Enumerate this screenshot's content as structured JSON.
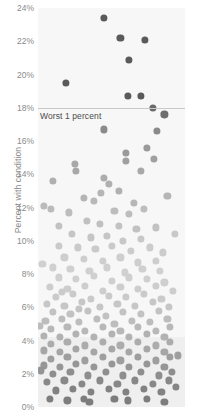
{
  "chart_data": {
    "type": "scatter",
    "title": "",
    "subtitle": "",
    "xlabel": "",
    "ylabel": "Percent with condition",
    "ylim": [
      0,
      24
    ],
    "xlim": [
      0,
      100
    ],
    "grid": false,
    "legend": null,
    "y_ticks": [
      "0%",
      "2%",
      "4%",
      "6%",
      "8%",
      "10%",
      "12%",
      "14%",
      "16%",
      "18%",
      "20%",
      "22%",
      "24%"
    ],
    "y_tick_values": [
      0,
      2,
      4,
      6,
      8,
      10,
      12,
      14,
      16,
      18,
      20,
      22,
      24
    ],
    "x_ticks": [],
    "annotations": [
      {
        "name": "worst-1-percent",
        "text": "Worst 1 percent",
        "y_value": 18,
        "line": true
      }
    ],
    "shaded_bands": [
      {
        "name": "low-band",
        "y_from": 0,
        "y_to": 4.2,
        "color": "#efefef"
      }
    ],
    "panel_background": "#f7f7f7",
    "dot_colors": {
      "very_high": "#5a5a5a",
      "high": "#9a9a9a",
      "mid": "#bdbdbd",
      "low_mid": "#cfcfcf",
      "light": "#dedede",
      "dense_dark": "#8e8e8e",
      "bottom": "#7d7d7d"
    },
    "points": [
      {
        "x": 45,
        "y": 23.4,
        "r": 3.6,
        "c": "#5a5a5a"
      },
      {
        "x": 56,
        "y": 22.2,
        "r": 3.6,
        "c": "#5a5a5a"
      },
      {
        "x": 73,
        "y": 22.1,
        "r": 3.6,
        "c": "#5a5a5a"
      },
      {
        "x": 62,
        "y": 20.9,
        "r": 3.6,
        "c": "#5a5a5a"
      },
      {
        "x": 19,
        "y": 19.5,
        "r": 3.6,
        "c": "#5a5a5a"
      },
      {
        "x": 61,
        "y": 18.7,
        "r": 3.6,
        "c": "#5a5a5a"
      },
      {
        "x": 70,
        "y": 18.7,
        "r": 3.6,
        "c": "#5a5a5a"
      },
      {
        "x": 78,
        "y": 18.0,
        "r": 3.6,
        "c": "#6a6a6a"
      },
      {
        "x": 86,
        "y": 17.6,
        "r": 3.6,
        "c": "#6e6e6e"
      },
      {
        "x": 45,
        "y": 16.7,
        "r": 3.6,
        "c": "#8a8a8a"
      },
      {
        "x": 81,
        "y": 16.6,
        "r": 3.6,
        "c": "#8a8a8a"
      },
      {
        "x": 74,
        "y": 15.6,
        "r": 3.6,
        "c": "#9a9a9a"
      },
      {
        "x": 60,
        "y": 15.3,
        "r": 3.6,
        "c": "#9a9a9a"
      },
      {
        "x": 60,
        "y": 14.8,
        "r": 3.6,
        "c": "#a0a0a0"
      },
      {
        "x": 79,
        "y": 14.9,
        "r": 3.6,
        "c": "#a0a0a0"
      },
      {
        "x": 25,
        "y": 14.6,
        "r": 3.6,
        "c": "#a8a8a8"
      },
      {
        "x": 26,
        "y": 14.2,
        "r": 3.6,
        "c": "#a8a8a8"
      },
      {
        "x": 70,
        "y": 14.2,
        "r": 3.6,
        "c": "#a8a8a8"
      },
      {
        "x": 45,
        "y": 13.8,
        "r": 3.6,
        "c": "#adadad"
      },
      {
        "x": 10,
        "y": 13.6,
        "r": 3.6,
        "c": "#b0b0b0"
      },
      {
        "x": 48,
        "y": 13.4,
        "r": 3.6,
        "c": "#b0b0b0"
      },
      {
        "x": 43,
        "y": 12.9,
        "r": 3.6,
        "c": "#b5b5b5"
      },
      {
        "x": 31,
        "y": 12.6,
        "r": 3.6,
        "c": "#b5b5b5"
      },
      {
        "x": 38,
        "y": 12.4,
        "r": 3.6,
        "c": "#b8b8b8"
      },
      {
        "x": 4,
        "y": 12.1,
        "r": 3.6,
        "c": "#bbbbbb"
      },
      {
        "x": 9,
        "y": 11.9,
        "r": 3.6,
        "c": "#bbbbbb"
      },
      {
        "x": 21,
        "y": 11.7,
        "r": 3.6,
        "c": "#bdbdbd"
      },
      {
        "x": 52,
        "y": 11.8,
        "r": 3.6,
        "c": "#bdbdbd"
      },
      {
        "x": 62,
        "y": 11.6,
        "r": 3.6,
        "c": "#bdbdbd"
      },
      {
        "x": 72,
        "y": 11.9,
        "r": 3.6,
        "c": "#bdbdbd"
      },
      {
        "x": 33,
        "y": 11.2,
        "r": 3.6,
        "c": "#c0c0c0"
      },
      {
        "x": 42,
        "y": 11.0,
        "r": 3.6,
        "c": "#c0c0c0"
      },
      {
        "x": 55,
        "y": 10.9,
        "r": 3.6,
        "c": "#c2c2c2"
      },
      {
        "x": 67,
        "y": 10.7,
        "r": 3.6,
        "c": "#c2c2c2"
      },
      {
        "x": 80,
        "y": 10.8,
        "r": 3.6,
        "c": "#c2c2c2"
      },
      {
        "x": 23,
        "y": 10.4,
        "r": 3.6,
        "c": "#c5c5c5"
      },
      {
        "x": 36,
        "y": 10.2,
        "r": 3.6,
        "c": "#c5c5c5"
      },
      {
        "x": 47,
        "y": 10.3,
        "r": 3.6,
        "c": "#c5c5c5"
      },
      {
        "x": 58,
        "y": 10.0,
        "r": 3.6,
        "c": "#c8c8c8"
      },
      {
        "x": 70,
        "y": 10.1,
        "r": 3.6,
        "c": "#c8c8c8"
      },
      {
        "x": 14,
        "y": 9.7,
        "r": 3.6,
        "c": "#cacaca"
      },
      {
        "x": 27,
        "y": 9.6,
        "r": 3.6,
        "c": "#cacaca"
      },
      {
        "x": 39,
        "y": 9.5,
        "r": 3.6,
        "c": "#cacaca"
      },
      {
        "x": 50,
        "y": 9.7,
        "r": 3.6,
        "c": "#cacaca"
      },
      {
        "x": 63,
        "y": 9.4,
        "r": 3.6,
        "c": "#cccccc"
      },
      {
        "x": 76,
        "y": 9.6,
        "r": 3.6,
        "c": "#cccccc"
      },
      {
        "x": 85,
        "y": 9.3,
        "r": 3.6,
        "c": "#cccccc"
      },
      {
        "x": 18,
        "y": 9.0,
        "r": 3.6,
        "c": "#cecece"
      },
      {
        "x": 31,
        "y": 8.9,
        "r": 3.6,
        "c": "#cecece"
      },
      {
        "x": 44,
        "y": 8.8,
        "r": 3.6,
        "c": "#cecece"
      },
      {
        "x": 56,
        "y": 9.0,
        "r": 3.6,
        "c": "#cecece"
      },
      {
        "x": 68,
        "y": 8.7,
        "r": 3.6,
        "c": "#cecece"
      },
      {
        "x": 80,
        "y": 8.8,
        "r": 3.6,
        "c": "#cecece"
      },
      {
        "x": 10,
        "y": 8.4,
        "r": 3.6,
        "c": "#d0d0d0"
      },
      {
        "x": 22,
        "y": 8.3,
        "r": 3.6,
        "c": "#d0d0d0"
      },
      {
        "x": 35,
        "y": 8.2,
        "r": 3.6,
        "c": "#d0d0d0"
      },
      {
        "x": 47,
        "y": 8.4,
        "r": 3.6,
        "c": "#d0d0d0"
      },
      {
        "x": 59,
        "y": 8.1,
        "r": 3.6,
        "c": "#d0d0d0"
      },
      {
        "x": 71,
        "y": 8.3,
        "r": 3.6,
        "c": "#d0d0d0"
      },
      {
        "x": 83,
        "y": 8.2,
        "r": 3.6,
        "c": "#d0d0d0"
      },
      {
        "x": 14,
        "y": 7.8,
        "r": 3.6,
        "c": "#d0d0d0"
      },
      {
        "x": 26,
        "y": 7.7,
        "r": 3.6,
        "c": "#d0d0d0"
      },
      {
        "x": 38,
        "y": 7.9,
        "r": 3.6,
        "c": "#d0d0d0"
      },
      {
        "x": 50,
        "y": 7.6,
        "r": 3.6,
        "c": "#cfcfcf"
      },
      {
        "x": 62,
        "y": 7.8,
        "r": 3.6,
        "c": "#cfcfcf"
      },
      {
        "x": 74,
        "y": 7.7,
        "r": 3.6,
        "c": "#cfcfcf"
      },
      {
        "x": 86,
        "y": 7.5,
        "r": 3.6,
        "c": "#cfcfcf"
      },
      {
        "x": 8,
        "y": 7.2,
        "r": 3.6,
        "c": "#cdcdcd"
      },
      {
        "x": 20,
        "y": 7.1,
        "r": 3.6,
        "c": "#cdcdcd"
      },
      {
        "x": 32,
        "y": 7.3,
        "r": 3.6,
        "c": "#cdcdcd"
      },
      {
        "x": 44,
        "y": 7.0,
        "r": 3.6,
        "c": "#cdcdcd"
      },
      {
        "x": 56,
        "y": 7.2,
        "r": 3.6,
        "c": "#cdcdcd"
      },
      {
        "x": 68,
        "y": 7.1,
        "r": 3.6,
        "c": "#cdcdcd"
      },
      {
        "x": 80,
        "y": 7.3,
        "r": 3.6,
        "c": "#cdcdcd"
      },
      {
        "x": 12,
        "y": 6.6,
        "r": 3.6,
        "c": "#cacaca"
      },
      {
        "x": 24,
        "y": 6.8,
        "r": 3.6,
        "c": "#cacaca"
      },
      {
        "x": 36,
        "y": 6.5,
        "r": 3.6,
        "c": "#cacaca"
      },
      {
        "x": 48,
        "y": 6.7,
        "r": 3.6,
        "c": "#cacaca"
      },
      {
        "x": 60,
        "y": 6.6,
        "r": 3.6,
        "c": "#cacaca"
      },
      {
        "x": 72,
        "y": 6.8,
        "r": 3.6,
        "c": "#cacaca"
      },
      {
        "x": 84,
        "y": 6.5,
        "r": 3.6,
        "c": "#cacaca"
      },
      {
        "x": 6,
        "y": 6.2,
        "r": 3.6,
        "c": "#c6c6c6"
      },
      {
        "x": 18,
        "y": 6.1,
        "r": 3.6,
        "c": "#c6c6c6"
      },
      {
        "x": 30,
        "y": 6.3,
        "r": 3.6,
        "c": "#c6c6c6"
      },
      {
        "x": 42,
        "y": 6.0,
        "r": 3.6,
        "c": "#c6c6c6"
      },
      {
        "x": 54,
        "y": 6.2,
        "r": 3.6,
        "c": "#c6c6c6"
      },
      {
        "x": 66,
        "y": 6.1,
        "r": 3.6,
        "c": "#c6c6c6"
      },
      {
        "x": 78,
        "y": 6.3,
        "r": 3.6,
        "c": "#c6c6c6"
      },
      {
        "x": 89,
        "y": 6.0,
        "r": 3.6,
        "c": "#c6c6c6"
      },
      {
        "x": 10,
        "y": 5.7,
        "r": 3.6,
        "c": "#c2c2c2"
      },
      {
        "x": 22,
        "y": 5.6,
        "r": 3.6,
        "c": "#c2c2c2"
      },
      {
        "x": 34,
        "y": 5.8,
        "r": 3.6,
        "c": "#c2c2c2"
      },
      {
        "x": 46,
        "y": 5.5,
        "r": 3.6,
        "c": "#c2c2c2"
      },
      {
        "x": 58,
        "y": 5.7,
        "r": 3.6,
        "c": "#c2c2c2"
      },
      {
        "x": 70,
        "y": 5.6,
        "r": 3.6,
        "c": "#c2c2c2"
      },
      {
        "x": 82,
        "y": 5.8,
        "r": 3.6,
        "c": "#c2c2c2"
      },
      {
        "x": 5,
        "y": 5.2,
        "r": 3.6,
        "c": "#bdbdbd"
      },
      {
        "x": 16,
        "y": 5.3,
        "r": 3.6,
        "c": "#bdbdbd"
      },
      {
        "x": 28,
        "y": 5.1,
        "r": 3.6,
        "c": "#bdbdbd"
      },
      {
        "x": 40,
        "y": 5.3,
        "r": 3.6,
        "c": "#bdbdbd"
      },
      {
        "x": 52,
        "y": 5.0,
        "r": 3.6,
        "c": "#bdbdbd"
      },
      {
        "x": 64,
        "y": 5.2,
        "r": 3.6,
        "c": "#bdbdbd"
      },
      {
        "x": 76,
        "y": 5.1,
        "r": 3.6,
        "c": "#bdbdbd"
      },
      {
        "x": 88,
        "y": 5.3,
        "r": 3.6,
        "c": "#bdbdbd"
      },
      {
        "x": 9,
        "y": 4.7,
        "r": 3.6,
        "c": "#b8b8b8"
      },
      {
        "x": 20,
        "y": 4.8,
        "r": 3.6,
        "c": "#b8b8b8"
      },
      {
        "x": 32,
        "y": 4.6,
        "r": 3.6,
        "c": "#b8b8b8"
      },
      {
        "x": 44,
        "y": 4.8,
        "r": 3.6,
        "c": "#b8b8b8"
      },
      {
        "x": 56,
        "y": 4.6,
        "r": 3.6,
        "c": "#b8b8b8"
      },
      {
        "x": 68,
        "y": 4.8,
        "r": 3.6,
        "c": "#b8b8b8"
      },
      {
        "x": 80,
        "y": 4.6,
        "r": 3.6,
        "c": "#b8b8b8"
      },
      {
        "x": 90,
        "y": 4.8,
        "r": 3.6,
        "c": "#b8b8b8"
      },
      {
        "x": 4,
        "y": 4.3,
        "r": 3.6,
        "c": "#b2b2b2"
      },
      {
        "x": 15,
        "y": 4.2,
        "r": 3.6,
        "c": "#b2b2b2"
      },
      {
        "x": 26,
        "y": 4.4,
        "r": 3.6,
        "c": "#b2b2b2"
      },
      {
        "x": 38,
        "y": 4.2,
        "r": 3.6,
        "c": "#b2b2b2"
      },
      {
        "x": 50,
        "y": 4.4,
        "r": 3.6,
        "c": "#b2b2b2"
      },
      {
        "x": 62,
        "y": 4.2,
        "r": 3.6,
        "c": "#b2b2b2"
      },
      {
        "x": 74,
        "y": 4.4,
        "r": 3.6,
        "c": "#b2b2b2"
      },
      {
        "x": 86,
        "y": 4.2,
        "r": 3.6,
        "c": "#b2b2b2"
      },
      {
        "x": 9,
        "y": 3.8,
        "r": 3.6,
        "c": "#acacac"
      },
      {
        "x": 20,
        "y": 3.9,
        "r": 3.6,
        "c": "#acacac"
      },
      {
        "x": 32,
        "y": 3.7,
        "r": 3.6,
        "c": "#acacac"
      },
      {
        "x": 44,
        "y": 3.9,
        "r": 3.6,
        "c": "#acacac"
      },
      {
        "x": 56,
        "y": 3.7,
        "r": 3.6,
        "c": "#acacac"
      },
      {
        "x": 68,
        "y": 3.9,
        "r": 3.6,
        "c": "#acacac"
      },
      {
        "x": 80,
        "y": 3.7,
        "r": 3.6,
        "c": "#acacac"
      },
      {
        "x": 90,
        "y": 3.9,
        "r": 3.6,
        "c": "#acacac"
      },
      {
        "x": 4,
        "y": 3.4,
        "r": 3.6,
        "c": "#a6a6a6"
      },
      {
        "x": 15,
        "y": 3.3,
        "r": 3.6,
        "c": "#a6a6a6"
      },
      {
        "x": 26,
        "y": 3.5,
        "r": 3.6,
        "c": "#a6a6a6"
      },
      {
        "x": 38,
        "y": 3.3,
        "r": 3.6,
        "c": "#a6a6a6"
      },
      {
        "x": 50,
        "y": 3.5,
        "r": 3.6,
        "c": "#a6a6a6"
      },
      {
        "x": 62,
        "y": 3.3,
        "r": 3.6,
        "c": "#a6a6a6"
      },
      {
        "x": 74,
        "y": 3.5,
        "r": 3.6,
        "c": "#a6a6a6"
      },
      {
        "x": 86,
        "y": 3.3,
        "r": 3.6,
        "c": "#a6a6a6"
      },
      {
        "x": 9,
        "y": 2.9,
        "r": 3.6,
        "c": "#9e9e9e"
      },
      {
        "x": 20,
        "y": 3.0,
        "r": 3.6,
        "c": "#9e9e9e"
      },
      {
        "x": 32,
        "y": 2.8,
        "r": 3.6,
        "c": "#9e9e9e"
      },
      {
        "x": 44,
        "y": 3.0,
        "r": 3.6,
        "c": "#9e9e9e"
      },
      {
        "x": 56,
        "y": 2.8,
        "r": 3.6,
        "c": "#9e9e9e"
      },
      {
        "x": 68,
        "y": 3.0,
        "r": 3.6,
        "c": "#9e9e9e"
      },
      {
        "x": 80,
        "y": 2.8,
        "r": 3.6,
        "c": "#9e9e9e"
      },
      {
        "x": 90,
        "y": 3.0,
        "r": 3.6,
        "c": "#9e9e9e"
      },
      {
        "x": 4,
        "y": 2.5,
        "r": 3.6,
        "c": "#969696"
      },
      {
        "x": 15,
        "y": 2.4,
        "r": 3.6,
        "c": "#969696"
      },
      {
        "x": 26,
        "y": 2.6,
        "r": 3.6,
        "c": "#969696"
      },
      {
        "x": 38,
        "y": 2.4,
        "r": 3.6,
        "c": "#969696"
      },
      {
        "x": 50,
        "y": 2.6,
        "r": 3.6,
        "c": "#969696"
      },
      {
        "x": 62,
        "y": 2.4,
        "r": 3.6,
        "c": "#969696"
      },
      {
        "x": 74,
        "y": 2.6,
        "r": 3.6,
        "c": "#969696"
      },
      {
        "x": 86,
        "y": 2.4,
        "r": 3.6,
        "c": "#969696"
      },
      {
        "x": 10,
        "y": 2.0,
        "r": 3.6,
        "c": "#8e8e8e"
      },
      {
        "x": 22,
        "y": 2.1,
        "r": 3.6,
        "c": "#8e8e8e"
      },
      {
        "x": 34,
        "y": 1.9,
        "r": 3.6,
        "c": "#8e8e8e"
      },
      {
        "x": 46,
        "y": 2.1,
        "r": 3.6,
        "c": "#8e8e8e"
      },
      {
        "x": 58,
        "y": 1.9,
        "r": 3.6,
        "c": "#8e8e8e"
      },
      {
        "x": 70,
        "y": 2.1,
        "r": 3.6,
        "c": "#8e8e8e"
      },
      {
        "x": 82,
        "y": 1.9,
        "r": 3.6,
        "c": "#8e8e8e"
      },
      {
        "x": 91,
        "y": 2.1,
        "r": 3.6,
        "c": "#8e8e8e"
      },
      {
        "x": 6,
        "y": 1.5,
        "r": 3.6,
        "c": "#888888"
      },
      {
        "x": 18,
        "y": 1.6,
        "r": 3.6,
        "c": "#888888"
      },
      {
        "x": 30,
        "y": 1.4,
        "r": 3.6,
        "c": "#888888"
      },
      {
        "x": 42,
        "y": 1.6,
        "r": 3.6,
        "c": "#888888"
      },
      {
        "x": 54,
        "y": 1.4,
        "r": 3.6,
        "c": "#888888"
      },
      {
        "x": 66,
        "y": 1.6,
        "r": 3.6,
        "c": "#888888"
      },
      {
        "x": 78,
        "y": 1.4,
        "r": 3.6,
        "c": "#888888"
      },
      {
        "x": 89,
        "y": 1.6,
        "r": 3.6,
        "c": "#888888"
      },
      {
        "x": 12,
        "y": 1.0,
        "r": 3.6,
        "c": "#828282"
      },
      {
        "x": 24,
        "y": 1.1,
        "r": 3.6,
        "c": "#828282"
      },
      {
        "x": 36,
        "y": 0.9,
        "r": 3.6,
        "c": "#828282"
      },
      {
        "x": 48,
        "y": 1.1,
        "r": 3.6,
        "c": "#828282"
      },
      {
        "x": 60,
        "y": 0.9,
        "r": 3.6,
        "c": "#828282"
      },
      {
        "x": 72,
        "y": 1.1,
        "r": 3.6,
        "c": "#828282"
      },
      {
        "x": 84,
        "y": 0.9,
        "r": 3.6,
        "c": "#828282"
      },
      {
        "x": 8,
        "y": 0.5,
        "r": 3.6,
        "c": "#7d7d7d"
      },
      {
        "x": 20,
        "y": 0.4,
        "r": 3.6,
        "c": "#7d7d7d"
      },
      {
        "x": 31,
        "y": 0.5,
        "r": 3.6,
        "c": "#7d7d7d"
      },
      {
        "x": 35,
        "y": 0.3,
        "r": 3.6,
        "c": "#7d7d7d"
      },
      {
        "x": 52,
        "y": 0.5,
        "r": 3.6,
        "c": "#7d7d7d"
      },
      {
        "x": 61,
        "y": 0.4,
        "r": 3.6,
        "c": "#7d7d7d"
      },
      {
        "x": 74,
        "y": 0.5,
        "r": 3.6,
        "c": "#7d7d7d"
      },
      {
        "x": 86,
        "y": 0.3,
        "r": 3.6,
        "c": "#7d7d7d"
      },
      {
        "x": 28,
        "y": 5.9,
        "r": 3.6,
        "c": "#c4c4c4"
      },
      {
        "x": 16,
        "y": 6.9,
        "r": 3.6,
        "c": "#cbcbcb"
      },
      {
        "x": 65,
        "y": 12.3,
        "r": 3.6,
        "c": "#b6b6b6"
      },
      {
        "x": 55,
        "y": 13.0,
        "r": 3.6,
        "c": "#b0b0b0"
      },
      {
        "x": 88,
        "y": 12.7,
        "r": 3.6,
        "c": "#b6b6b6"
      },
      {
        "x": 14,
        "y": 10.9,
        "r": 3.6,
        "c": "#c2c2c2"
      },
      {
        "x": 3,
        "y": 8.6,
        "r": 3.6,
        "c": "#d0d0d0"
      },
      {
        "x": 92,
        "y": 7.0,
        "r": 3.6,
        "c": "#cdcdcd"
      },
      {
        "x": 93,
        "y": 10.4,
        "r": 3.6,
        "c": "#c8c8c8"
      },
      {
        "x": 2,
        "y": 2.2,
        "r": 3.6,
        "c": "#949494"
      },
      {
        "x": 95,
        "y": 3.1,
        "r": 3.6,
        "c": "#9e9e9e"
      },
      {
        "x": 94,
        "y": 1.2,
        "r": 3.6,
        "c": "#858585"
      },
      {
        "x": 1,
        "y": 4.9,
        "r": 3.6,
        "c": "#bcbcbc"
      }
    ]
  }
}
